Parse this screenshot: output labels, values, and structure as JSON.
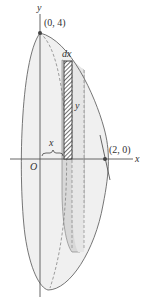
{
  "figure": {
    "axis_labels": {
      "x": "x",
      "y": "y"
    },
    "origin_label": "O",
    "point_top": "(0, 4)",
    "point_right": "(2, 0)",
    "strip_width_label": "dx",
    "strip_height_label": "y",
    "radius_label": "x",
    "colors": {
      "line": "#555555",
      "shade_light": "#e6e6e6",
      "shade_dark": "#c8c8c8",
      "hatch": "#333333"
    }
  }
}
